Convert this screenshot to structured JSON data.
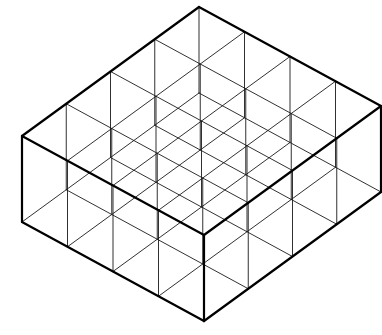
{
  "figure": {
    "kind": "line-drawing",
    "background_color": "#ffffff",
    "line_color": "#000000",
    "interior_line_color": "#1a1a1a",
    "outline_width": 2.2,
    "interior_width": 0.9,
    "grid": {
      "columns": 4,
      "rows": 4,
      "cells_total": 16
    },
    "geometry": {
      "top_apex": {
        "x": 199,
        "y": 7
      },
      "left_corner_top": {
        "x": 17,
        "y": 106
      },
      "right_corner_top": {
        "x": 372,
        "y": 113
      },
      "bottom_apex_top": {
        "x": 198,
        "y": 242
      },
      "wall_height": 86,
      "u_axis": {
        "dx": 45.5,
        "dy": 24.75
      },
      "v_axis": {
        "dx": -44.25,
        "dy": 32.25
      }
    }
  }
}
